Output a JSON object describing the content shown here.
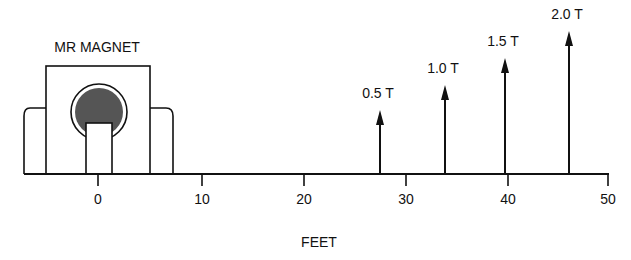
{
  "title": "MR MAGNET",
  "axis": {
    "label": "FEET",
    "ticks": [
      {
        "value": "0",
        "x": 98
      },
      {
        "value": "10",
        "x": 202
      },
      {
        "value": "20",
        "x": 304
      },
      {
        "value": "30",
        "x": 406
      },
      {
        "value": "40",
        "x": 508
      },
      {
        "value": "50",
        "x": 608
      }
    ]
  },
  "field_markers": [
    {
      "label": "0.5 T",
      "feet": 27.6,
      "x": 380,
      "top": 110
    },
    {
      "label": "1.0 T",
      "feet": 33.8,
      "x": 445,
      "top": 85
    },
    {
      "label": "1.5 T",
      "feet": 39.6,
      "x": 505,
      "top": 58
    },
    {
      "label": "2.0 T",
      "feet": 45.8,
      "x": 569,
      "top": 31
    }
  ],
  "colors": {
    "ink": "#111111",
    "fill": "#555555"
  }
}
